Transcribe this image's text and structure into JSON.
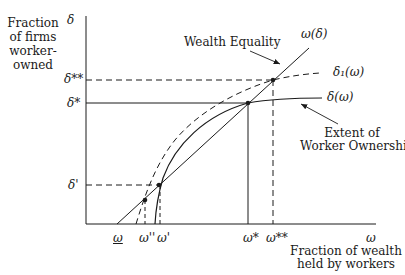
{
  "diagram": {
    "y_axis": {
      "symbol": "δ",
      "title_lines": [
        "Fraction",
        "of firms",
        "worker-",
        "owned"
      ]
    },
    "x_axis": {
      "symbol": "ω",
      "title_lines": [
        "Fraction of wealth",
        "held by workers"
      ]
    },
    "y_ticks": [
      {
        "label": "δ**",
        "y": 80
      },
      {
        "label": "δ*",
        "y": 103
      },
      {
        "label": "δ'",
        "y": 185
      }
    ],
    "x_ticks": [
      {
        "label": "ω",
        "underline": true,
        "x": 117
      },
      {
        "label": "ω''",
        "x": 145
      },
      {
        "label": "ω'",
        "x": 159
      },
      {
        "label": "ω*",
        "x": 248
      },
      {
        "label": "ω**",
        "x": 273
      }
    ],
    "curves": {
      "wealth_line_label": "ω(δ)",
      "dashed_curve_label": "δ₁(ω)",
      "solid_curve_label": "δ(ω)"
    },
    "annotations": {
      "wealth_equality": "Wealth Equality",
      "worker_ownership_lines": [
        "Extent of",
        "Worker Ownership"
      ]
    },
    "colors": {
      "ink": "#1a1a1a",
      "background": "#ffffff"
    }
  }
}
